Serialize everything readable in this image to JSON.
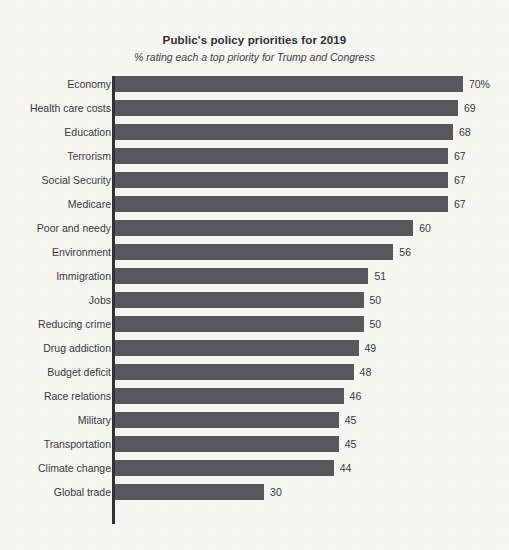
{
  "chart_data": {
    "type": "bar",
    "orientation": "horizontal",
    "title": "Public's policy priorities for 2019",
    "subtitle": "% rating each a top priority for Trump and Congress",
    "xlabel": "",
    "ylabel": "",
    "xlim": [
      0,
      70
    ],
    "grid": false,
    "legend": false,
    "bar_color": "#59595b",
    "axis_color": "#333335",
    "text_color": "#3a3a3a",
    "background_color": "#f7f7f6",
    "categories": [
      "Economy",
      "Health care costs",
      "Education",
      "Terrorism",
      "Social Security",
      "Medicare",
      "Poor and needy",
      "Environment",
      "Immigration",
      "Jobs",
      "Reducing crime",
      "Drug addiction",
      "Budget deficit",
      "Race relations",
      "Military",
      "Transportation",
      "Climate change",
      "Global trade"
    ],
    "values": [
      70,
      69,
      68,
      67,
      67,
      67,
      60,
      56,
      51,
      50,
      50,
      49,
      48,
      46,
      45,
      45,
      44,
      30
    ],
    "value_labels": [
      "70%",
      "69",
      "68",
      "67",
      "67",
      "67",
      "60",
      "56",
      "51",
      "50",
      "50",
      "49",
      "48",
      "46",
      "45",
      "45",
      "44",
      "30"
    ]
  }
}
